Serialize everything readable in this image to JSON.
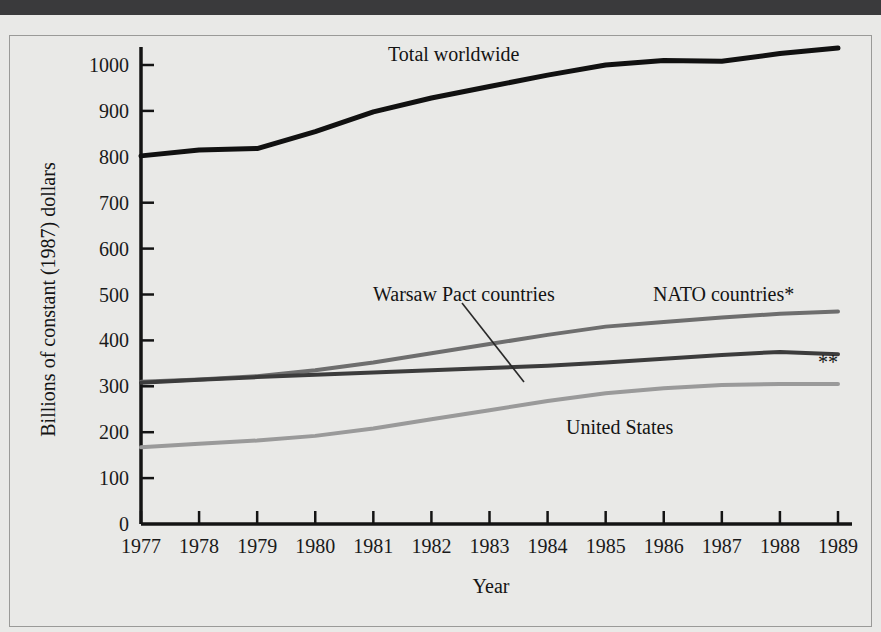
{
  "figure": {
    "y_axis_title": "Billions of constant (1987) dollars",
    "x_axis_title": "Year",
    "footnote_marker": "**"
  },
  "chart_data": {
    "type": "line",
    "title": "",
    "xlabel": "Year",
    "ylabel": "Billions of constant (1987) dollars",
    "xlim": [
      1977,
      1989
    ],
    "ylim": [
      0,
      1000
    ],
    "ytick_step": 100,
    "grid": false,
    "legend_position": "inline-annotations",
    "x": [
      1977,
      1978,
      1979,
      1980,
      1981,
      1982,
      1983,
      1984,
      1985,
      1986,
      1987,
      1988,
      1989
    ],
    "xticklabels": [
      "1977",
      "1978",
      "1979",
      "1980",
      "1981",
      "1982",
      "1983",
      "1984",
      "1985",
      "1986",
      "1987",
      "1988",
      "1989"
    ],
    "yticklabels": [
      "0",
      "100",
      "200",
      "300",
      "400",
      "500",
      "600",
      "700",
      "800",
      "900",
      "1000"
    ],
    "series": [
      {
        "name": "Total worldwide",
        "color": "#111111",
        "width": 5,
        "values": [
          802,
          815,
          818,
          855,
          898,
          928,
          953,
          978,
          1000,
          1010,
          1008,
          1025,
          1037
        ]
      },
      {
        "name": "NATO countries*",
        "color": "#6e6e6e",
        "width": 4,
        "values": [
          310,
          315,
          322,
          335,
          352,
          372,
          392,
          412,
          430,
          440,
          450,
          458,
          463
        ]
      },
      {
        "name": "Warsaw Pact countries",
        "color": "#3c3c3c",
        "width": 4,
        "values": [
          308,
          314,
          320,
          325,
          330,
          335,
          340,
          345,
          352,
          360,
          368,
          375,
          370
        ]
      },
      {
        "name": "United States",
        "color": "#9a9a9a",
        "width": 4,
        "values": [
          167,
          175,
          182,
          192,
          208,
          228,
          248,
          268,
          285,
          296,
          303,
          305,
          305
        ]
      }
    ],
    "annotations": [
      {
        "text": "Total worldwide",
        "x_px": 388,
        "y_px": 44
      },
      {
        "text": "Warsaw Pact countries",
        "x_px": 373,
        "y_px": 284
      },
      {
        "text": "NATO countries*",
        "x_px": 653,
        "y_px": 284
      },
      {
        "text": "United States",
        "x_px": 566,
        "y_px": 417
      },
      {
        "text": "**",
        "x_px": 818,
        "y_px": 352
      }
    ]
  }
}
